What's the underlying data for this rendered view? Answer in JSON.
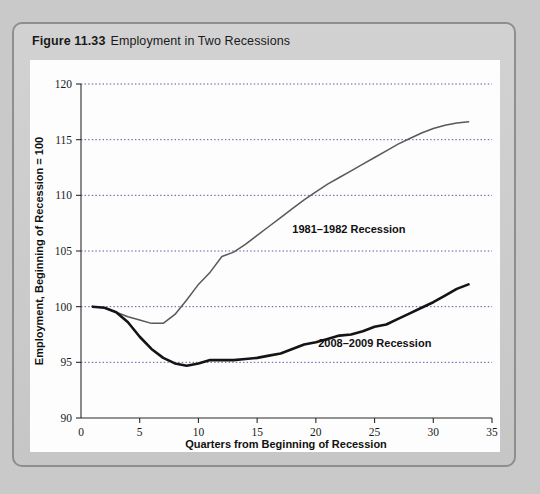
{
  "figure": {
    "number": "Figure 11.33",
    "title": "Employment in Two Recessions"
  },
  "chart_data": {
    "type": "line",
    "title": "Employment in Two Recessions",
    "xlabel": "Quarters from Beginning of Recession",
    "ylabel": "Employment, Beginning of Recession = 100",
    "xlim": [
      0,
      35
    ],
    "ylim": [
      90,
      120
    ],
    "xticks": [
      "0",
      "5",
      "10",
      "15",
      "20",
      "25",
      "30",
      "35"
    ],
    "yticks": [
      "90",
      "95",
      "100",
      "105",
      "110",
      "115",
      "120"
    ],
    "grid": "horizontal-dotted",
    "legend": "inline-labels",
    "series": [
      {
        "name": "1981–1982 Recession",
        "color": "#595959",
        "label_x": 18.0,
        "label_y": 106.6,
        "x": [
          1,
          2,
          3,
          4,
          5,
          6,
          7,
          8,
          9,
          10,
          11,
          12,
          13,
          14,
          15,
          16,
          17,
          18,
          19,
          20,
          21,
          22,
          23,
          24,
          25,
          26,
          27,
          28,
          29,
          30,
          31,
          32,
          33
        ],
        "values": [
          100.0,
          99.9,
          99.5,
          99.1,
          98.8,
          98.5,
          98.5,
          99.3,
          100.6,
          102.0,
          103.1,
          104.5,
          104.9,
          105.6,
          106.4,
          107.2,
          108.0,
          108.8,
          109.6,
          110.3,
          111.0,
          111.6,
          112.2,
          112.8,
          113.4,
          114.0,
          114.6,
          115.1,
          115.6,
          116.0,
          116.3,
          116.5,
          116.6
        ]
      },
      {
        "name": "2008–2009 Recession",
        "color": "#141414",
        "label_x": 20.2,
        "label_y": 96.4,
        "x": [
          1,
          2,
          3,
          4,
          5,
          6,
          7,
          8,
          9,
          10,
          11,
          12,
          13,
          14,
          15,
          16,
          17,
          18,
          19,
          20,
          21,
          22,
          23,
          24,
          25,
          26,
          27,
          28,
          29,
          30,
          31,
          32,
          33
        ],
        "values": [
          100.0,
          99.9,
          99.5,
          98.6,
          97.3,
          96.2,
          95.4,
          94.9,
          94.7,
          94.9,
          95.2,
          95.2,
          95.2,
          95.3,
          95.4,
          95.6,
          95.8,
          96.2,
          96.6,
          96.8,
          97.1,
          97.4,
          97.5,
          97.8,
          98.2,
          98.4,
          98.9,
          99.4,
          99.9,
          100.4,
          101.0,
          101.6,
          102.0
        ]
      }
    ]
  }
}
